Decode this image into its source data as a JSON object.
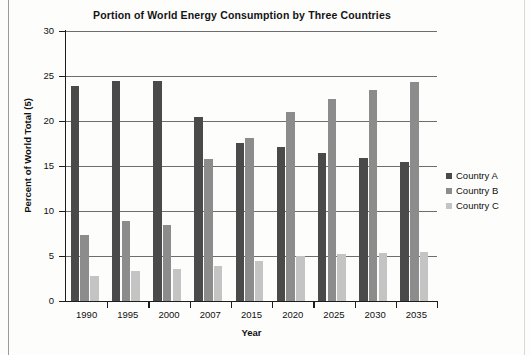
{
  "chart_data": {
    "type": "bar",
    "title": "Portion of World Energy Consumption by Three Countries",
    "xlabel": "Year",
    "ylabel": "Percent of World Total (5)",
    "categories": [
      "1990",
      "1995",
      "2000",
      "2007",
      "2015",
      "2020",
      "2025",
      "2030",
      "2035"
    ],
    "ylim": [
      0,
      30
    ],
    "yticks": [
      "0",
      "5",
      "10",
      "15",
      "20",
      "25",
      "30"
    ],
    "grid": true,
    "legend_position": "right",
    "series": [
      {
        "name": "Country A",
        "color": "#4a4a4a",
        "values": [
          23.9,
          24.4,
          24.4,
          20.5,
          17.6,
          17.1,
          16.5,
          15.9,
          15.4
        ]
      },
      {
        "name": "Country B",
        "color": "#8c8c8c",
        "values": [
          7.3,
          8.9,
          8.4,
          15.8,
          18.1,
          21.0,
          22.4,
          23.4,
          24.3
        ]
      },
      {
        "name": "Country C",
        "color": "#c4c4c4",
        "values": [
          2.8,
          3.3,
          3.6,
          3.9,
          4.5,
          5.0,
          5.2,
          5.3,
          5.4
        ]
      }
    ]
  }
}
